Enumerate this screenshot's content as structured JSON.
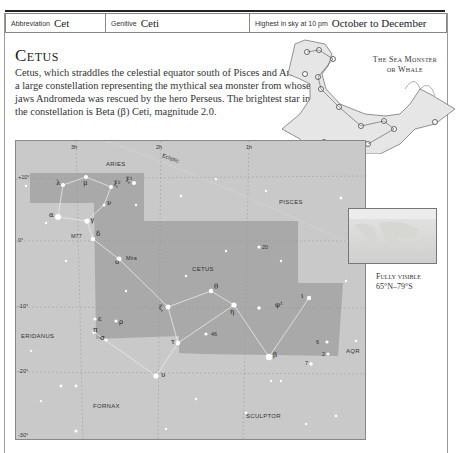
{
  "info_bar": {
    "abbreviation_label": "Abbreviation",
    "abbreviation_value": "Cet",
    "genitive_label": "Genitive",
    "genitive_value": "Ceti",
    "highest_label": "Highest in sky at 10 pm",
    "highest_value": "October to December"
  },
  "title": "Cetus",
  "description": "Cetus, which straddles the celestial equator south of Pisces and Aries, is a large constellation representing the mythical sea monster from whose jaws Andromeda was rescued by the hero Perseus. The brightest star in the constellation is Beta (β) Ceti, magnitude 2.0.",
  "figure": {
    "title_line1": "The Sea Monster",
    "title_line2": "or Whale"
  },
  "visibility": {
    "line1": "Fully visible",
    "line2": "65°N–79°S"
  },
  "map": {
    "ra_labels": [
      "3h",
      "2h",
      "1h"
    ],
    "dec_labels": [
      "+10°",
      "0°",
      "-10°",
      "-20°",
      "-30°"
    ],
    "ecliptic_label": "Ecliptic",
    "constellations": {
      "aries": "ARIES",
      "pisces": "PISCES",
      "cetus": "CETUS",
      "eridanus": "ERIDANUS",
      "fornax": "FORNAX",
      "sculptor": "SCULPTOR",
      "aqr": "AQR"
    },
    "stars": {
      "lambda": "λ",
      "mu": "μ",
      "xi2": "ξ²",
      "xi1": "ξ¹",
      "nu": "ν",
      "alpha": "α",
      "gamma": "γ",
      "delta": "δ",
      "m77": "M77",
      "omicron": "ο",
      "mira": "Mira",
      "theta": "θ",
      "zeta": "ζ",
      "eta": "η",
      "phi1": "φ¹",
      "iota": "ι",
      "epsilon": "ε",
      "rho": "ρ",
      "pi": "π",
      "sigma": "σ",
      "tau": "τ",
      "n46": "46",
      "beta": "β",
      "upsilon": "υ",
      "n20": "20",
      "n6": "6",
      "n2": "2",
      "n7": "7"
    }
  }
}
